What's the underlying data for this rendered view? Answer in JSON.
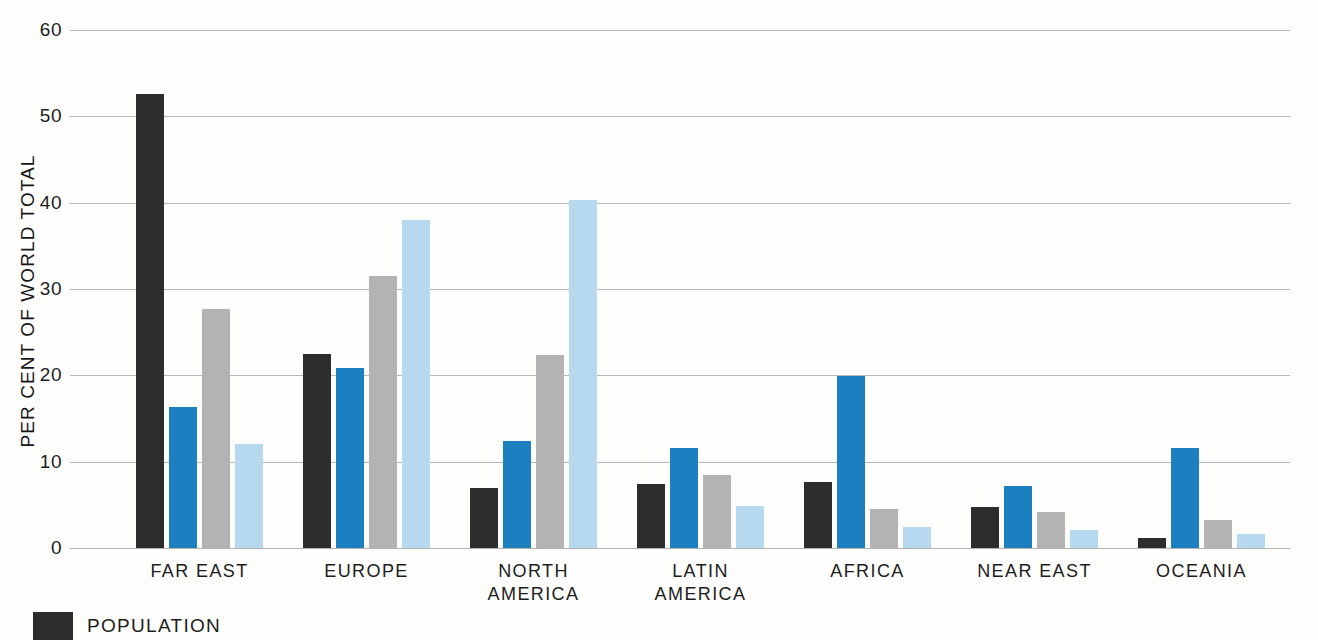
{
  "chart_data": {
    "type": "bar",
    "title": "",
    "subtitle": "",
    "xlabel": "",
    "ylabel": "PER CENT OF WORLD TOTAL",
    "ylim": [
      0,
      60
    ],
    "yticks": [
      0,
      10,
      20,
      30,
      40,
      50,
      60
    ],
    "ytick_labels": [
      "0",
      "10",
      "20",
      "30",
      "40",
      "50",
      "60"
    ],
    "grid": true,
    "legend_position": "bottom-left",
    "categories": [
      "FAR EAST",
      "EUROPE",
      "NORTH\nAMERICA",
      "LATIN\nAMERICA",
      "AFRICA",
      "NEAR EAST",
      "OCEANIA"
    ],
    "series": [
      {
        "name": "POPULATION",
        "color": "#2c2c2c",
        "values": [
          52.6,
          22.5,
          6.9,
          7.4,
          7.6,
          4.8,
          1.2
        ]
      },
      {
        "name": "SERIES-2",
        "color": "#1c7fbf",
        "values": [
          16.3,
          20.8,
          12.4,
          11.6,
          19.9,
          7.2,
          11.6
        ]
      },
      {
        "name": "SERIES-3",
        "color": "#b3b3b3",
        "values": [
          27.7,
          31.5,
          22.4,
          8.5,
          4.5,
          4.2,
          3.3
        ]
      },
      {
        "name": "SERIES-4",
        "color": "#b6d9ef",
        "values": [
          12.0,
          38.0,
          40.3,
          4.9,
          2.4,
          2.1,
          1.6
        ]
      }
    ],
    "legend_entries": [
      {
        "label": "POPULATION",
        "color": "#2c2c2c"
      }
    ]
  },
  "colors": {
    "series_1": "#2c2c2c",
    "series_2": "#1c7fbf",
    "series_3": "#b3b3b3",
    "series_4": "#b6d9ef",
    "gridline": "#8d8d8d",
    "text": "#1d1d1d",
    "background": "#fdfdfc"
  }
}
